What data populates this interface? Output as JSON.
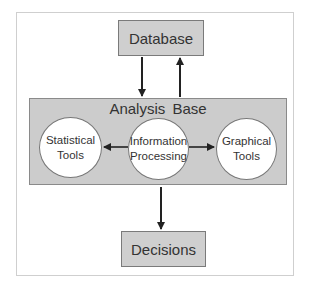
{
  "diagram": {
    "database": {
      "label": "Database"
    },
    "analysis_base": {
      "title": "Analysis  Base",
      "nodes": [
        {
          "id": "statistical",
          "line1": "Statistical",
          "line2": "Tools"
        },
        {
          "id": "information",
          "line1": "Information",
          "line2": "Processing"
        },
        {
          "id": "graphical",
          "line1": "Graphical",
          "line2": "Tools"
        }
      ]
    },
    "decisions": {
      "label": "Decisions"
    },
    "edges": [
      {
        "from": "Database",
        "to": "Analysis Base"
      },
      {
        "from": "Analysis Base",
        "to": "Database"
      },
      {
        "from": "Information Processing",
        "to": "Statistical Tools"
      },
      {
        "from": "Information Processing",
        "to": "Graphical Tools"
      },
      {
        "from": "Analysis Base",
        "to": "Decisions"
      }
    ],
    "colors": {
      "box_fill": "#cccccc",
      "ellipse_fill": "#ffffff",
      "arrow": "#222222",
      "frame": "#cfcfcf"
    }
  }
}
